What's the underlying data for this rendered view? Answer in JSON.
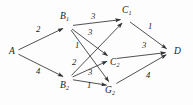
{
  "figure": {
    "type": "directed-weighted-graph",
    "background_color": "#fdfdfd",
    "stroke_color": "#333333",
    "text_color": "#1a1a1a"
  },
  "nodes": [
    {
      "id": "A",
      "base": "A",
      "sub": "",
      "x": 14,
      "y": 52,
      "label_x": 9,
      "label_y": 47
    },
    {
      "id": "B1",
      "base": "B",
      "sub": "1",
      "x": 68,
      "y": 26,
      "label_x": 60,
      "label_y": 12
    },
    {
      "id": "B2",
      "base": "B",
      "sub": "2",
      "x": 68,
      "y": 79,
      "label_x": 60,
      "label_y": 81
    },
    {
      "id": "C1",
      "base": "C",
      "sub": "1",
      "x": 126,
      "y": 19,
      "label_x": 122,
      "label_y": 6
    },
    {
      "id": "C2",
      "base": "C",
      "sub": "2",
      "x": 112,
      "y": 59,
      "label_x": 110,
      "label_y": 58
    },
    {
      "id": "G2",
      "base": "G",
      "sub": "2",
      "x": 112,
      "y": 86,
      "label_x": 105,
      "label_y": 86
    },
    {
      "id": "D",
      "base": "D",
      "sub": "",
      "x": 171,
      "y": 52,
      "label_x": 174,
      "label_y": 47
    }
  ],
  "edges": [
    {
      "from": "A",
      "to": "B1",
      "weight": "2",
      "label_x": 36,
      "label_y": 25
    },
    {
      "from": "A",
      "to": "B2",
      "weight": "4",
      "label_x": 36,
      "label_y": 67
    },
    {
      "from": "B1",
      "to": "C1",
      "weight": "3",
      "label_x": 91,
      "label_y": 12
    },
    {
      "from": "B1",
      "to": "C2",
      "weight": "3",
      "label_x": 88,
      "label_y": 28
    },
    {
      "from": "B1",
      "to": "G2",
      "weight": "1",
      "label_x": 75,
      "label_y": 41
    },
    {
      "from": "B2",
      "to": "C1",
      "weight": "2",
      "label_x": 72,
      "label_y": 58
    },
    {
      "from": "B2",
      "to": "C2",
      "weight": "3",
      "label_x": 88,
      "label_y": 68
    },
    {
      "from": "B2",
      "to": "G2",
      "weight": "1",
      "label_x": 87,
      "label_y": 81
    },
    {
      "from": "C1",
      "to": "D",
      "weight": "1",
      "label_x": 148,
      "label_y": 22
    },
    {
      "from": "C2",
      "to": "D",
      "weight": "3",
      "label_x": 142,
      "label_y": 41
    },
    {
      "from": "G2",
      "to": "D",
      "weight": "4",
      "label_x": 146,
      "label_y": 71
    }
  ],
  "chart_data": {
    "type": "diagram",
    "title": "",
    "nodes": [
      "A",
      "B1",
      "B2",
      "C1",
      "C2",
      "G2",
      "D"
    ],
    "edges": [
      {
        "source": "A",
        "target": "B1",
        "weight": 2
      },
      {
        "source": "A",
        "target": "B2",
        "weight": 4
      },
      {
        "source": "B1",
        "target": "C1",
        "weight": 3
      },
      {
        "source": "B1",
        "target": "C2",
        "weight": 3
      },
      {
        "source": "B1",
        "target": "G2",
        "weight": 1
      },
      {
        "source": "B2",
        "target": "C1",
        "weight": 2
      },
      {
        "source": "B2",
        "target": "C2",
        "weight": 3
      },
      {
        "source": "B2",
        "target": "G2",
        "weight": 1
      },
      {
        "source": "C1",
        "target": "D",
        "weight": 1
      },
      {
        "source": "C2",
        "target": "D",
        "weight": 3
      },
      {
        "source": "G2",
        "target": "D",
        "weight": 4
      }
    ]
  }
}
